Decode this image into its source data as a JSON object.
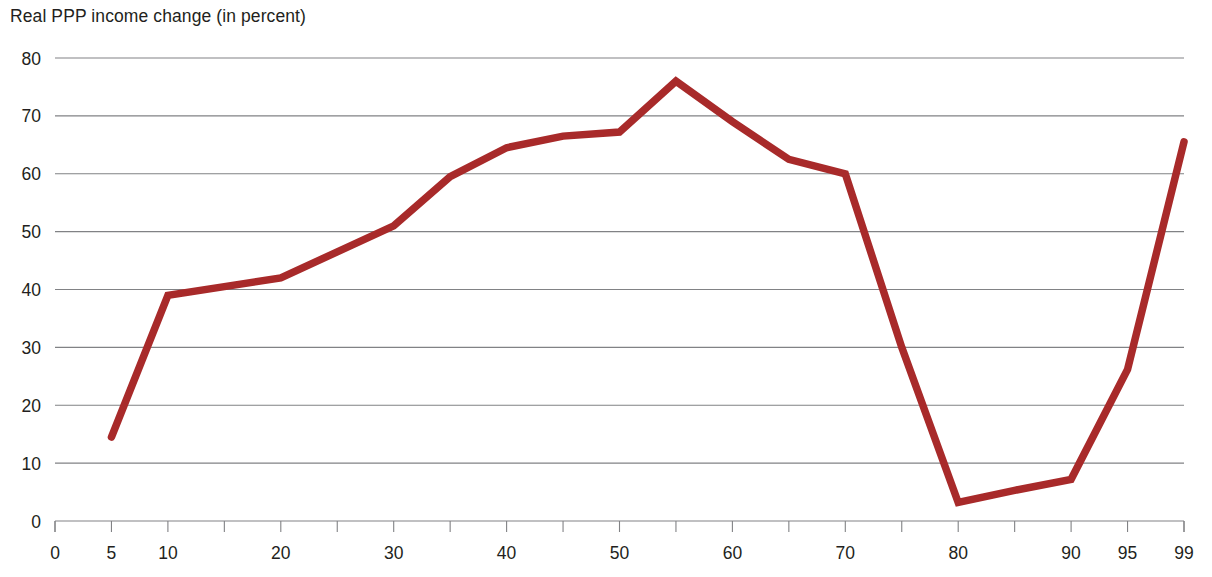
{
  "chart_data": {
    "type": "line",
    "title": "Real PPP income change (in percent)",
    "subtitle": "",
    "xlabel": "",
    "ylabel": "",
    "xlim": [
      0,
      100
    ],
    "ylim": [
      0,
      80
    ],
    "grid": true,
    "legend_position": "none",
    "series_color": "#a82a2a",
    "x_tick_labels": [
      "0",
      "5",
      "10",
      "20",
      "30",
      "40",
      "50",
      "60",
      "70",
      "80",
      "90",
      "95",
      "99"
    ],
    "x_tick_values": [
      0,
      5,
      10,
      20,
      30,
      40,
      50,
      60,
      70,
      80,
      90,
      95,
      99
    ],
    "x_minor_tick_values": [
      15,
      25,
      35,
      45,
      55,
      65,
      75,
      85
    ],
    "y_tick_labels": [
      "0",
      "10",
      "20",
      "30",
      "40",
      "50",
      "60",
      "70",
      "80"
    ],
    "y_tick_values": [
      0,
      10,
      20,
      30,
      40,
      50,
      60,
      70,
      80
    ],
    "series": [
      {
        "name": "Real PPP income change",
        "x": [
          5,
          10,
          15,
          20,
          25,
          30,
          35,
          40,
          45,
          50,
          55,
          60,
          65,
          70,
          75,
          80,
          85,
          90,
          95,
          99
        ],
        "values": [
          14.5,
          39.0,
          40.5,
          42.0,
          46.5,
          51.0,
          59.5,
          64.5,
          66.5,
          67.2,
          76.0,
          69.0,
          62.5,
          60.0,
          30.0,
          3.2,
          5.3,
          7.2,
          26.2,
          65.5
        ]
      }
    ],
    "annotations": []
  }
}
